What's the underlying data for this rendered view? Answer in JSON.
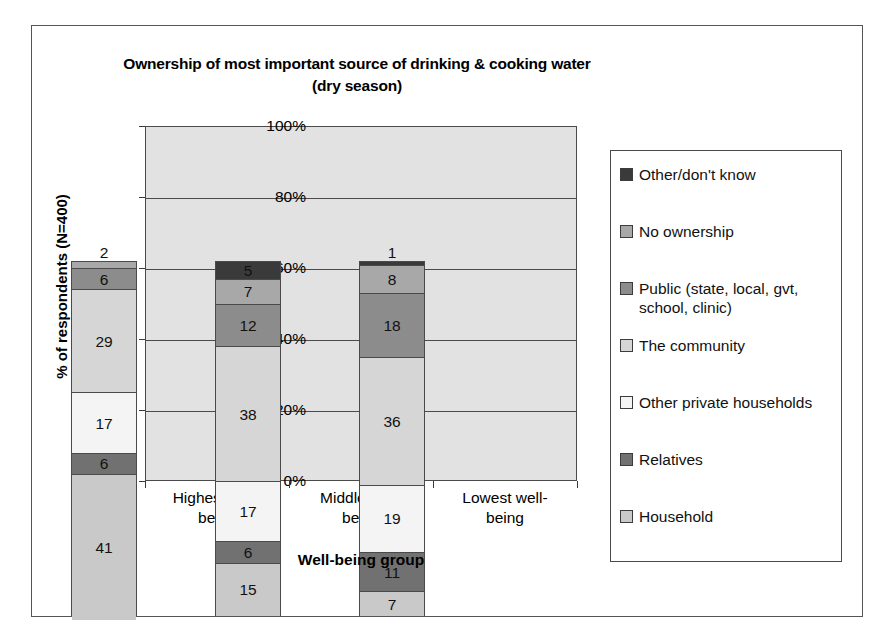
{
  "chart_data": {
    "type": "bar",
    "subtype": "stacked-100-percent",
    "title": "Ownership of most important source of drinking & cooking water (dry season)",
    "title_line1": "Ownership of most important source of drinking & cooking water",
    "title_line2": "(dry season)",
    "xlabel": "Well-being group",
    "ylabel": "% of respondents (N=400)",
    "ylim": [
      0,
      100
    ],
    "yticks": [
      "0%",
      "20%",
      "40%",
      "60%",
      "80%",
      "100%"
    ],
    "ytick_values": [
      0,
      20,
      40,
      60,
      80,
      100
    ],
    "grid": true,
    "legend_position": "right",
    "categories": [
      "Highest well-being",
      "Middle well-being",
      "Lowest well-being"
    ],
    "category_lines": [
      [
        "Highest well-",
        "being"
      ],
      [
        "Middle well-",
        "being"
      ],
      [
        "Lowest well-",
        "being"
      ]
    ],
    "series": [
      {
        "name": "Household",
        "color": "#c9c9c9",
        "values": [
          41,
          15,
          7
        ]
      },
      {
        "name": "Relatives",
        "color": "#717171",
        "values": [
          6,
          6,
          11
        ]
      },
      {
        "name": "Other private households",
        "color": "#f4f4f4",
        "values": [
          17,
          17,
          19
        ]
      },
      {
        "name": "The community",
        "color": "#d6d6d6",
        "values": [
          29,
          38,
          36
        ]
      },
      {
        "name": "Public (state, local, gvt, school, clinic)",
        "color": "#8c8c8c",
        "values": [
          6,
          12,
          18
        ]
      },
      {
        "name": "No ownership",
        "color": "#a8a8a8",
        "values": [
          2,
          7,
          8
        ]
      },
      {
        "name": "Other/don't know",
        "color": "#3a3a3a",
        "values": [
          0,
          5,
          1
        ]
      }
    ],
    "plot_background": "#e2e2e2",
    "frame_color": "#4a4a4a"
  },
  "legend": {
    "items": [
      {
        "label": "Other/don't know",
        "color": "#3a3a3a"
      },
      {
        "label": "No ownership",
        "color": "#a8a8a8"
      },
      {
        "label": "Public (state, local, gvt, school, clinic)",
        "color": "#8c8c8c"
      },
      {
        "label": "The community",
        "color": "#d6d6d6"
      },
      {
        "label": "Other private households",
        "color": "#f4f4f4"
      },
      {
        "label": "Relatives",
        "color": "#717171"
      },
      {
        "label": "Household",
        "color": "#c9c9c9"
      }
    ]
  }
}
